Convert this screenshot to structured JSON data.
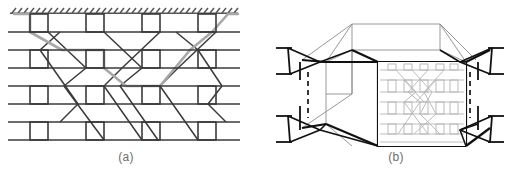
{
  "figure": {
    "type": "technical-schematic",
    "background_color": "#ffffff",
    "panels": [
      {
        "id": "a",
        "caption": "(a)",
        "description": "two-dimensional lattice network with crossing diagonal chains",
        "caption_color": "#6e6e6e"
      },
      {
        "id": "b",
        "caption": "(b)",
        "description": "three-dimensional perspective box with pinned supports and lattice front face",
        "caption_color": "#6e6e6e"
      }
    ]
  },
  "colors": {
    "line_dark": "#3a3a3a",
    "line_black": "#111111",
    "line_gray_path": "#a8a8a8",
    "line_thin_gray": "#8c8c8c",
    "line_light_lattice": "#b4b4b4",
    "hatch": "#555555",
    "caption": "#6e6e6e",
    "background": "#ffffff"
  },
  "panel_a": {
    "label": "(a)",
    "frame": {
      "x": 8,
      "y": 10,
      "width": 232,
      "height": 132
    },
    "boundary": {
      "name": "fixed-hatched-boundary",
      "y": 14,
      "x_start": 12,
      "x_end": 236,
      "hatch_count": 38,
      "hatch_angle_deg": 55
    },
    "band_count": 4,
    "band_rows": [
      {
        "top_y": 14,
        "bottom_y": 32
      },
      {
        "top_y": 50,
        "bottom_y": 68
      },
      {
        "top_y": 86,
        "bottom_y": 104
      },
      {
        "top_y": 122,
        "bottom_y": 140
      }
    ],
    "cells_per_band": 4,
    "cell_width": 18,
    "cell_x_positions": [
      30,
      86,
      142,
      198
    ],
    "horizontal_line_x": {
      "start": 8,
      "end": 240
    },
    "highlighted_path": {
      "name": "percolation-path",
      "color": "#a8a8a8",
      "stroke_width": 2.6,
      "points": "18,14 30,14 30,32 60,50 86,50 104,50 104,68 120,86 142,86 160,86 190,50 212,32 226,14 236,14"
    }
  },
  "panel_b": {
    "label": "(b)",
    "box": {
      "front_face": {
        "x": 378,
        "y": 62,
        "width": 88,
        "height": 84
      },
      "top_back_edge_y": 20,
      "perspective_offset_x": 52,
      "perspective_offset_y": 34
    },
    "front_face_lattice": {
      "name": "front-face-lattice",
      "color": "#b4b4b4",
      "rows": 4,
      "cells_per_row": 5
    },
    "supports": [
      {
        "name": "support-top-left",
        "x": 300,
        "y": 58,
        "facing": "left"
      },
      {
        "name": "support-top-right",
        "x": 478,
        "y": 58,
        "facing": "right"
      },
      {
        "name": "support-bottom-left",
        "x": 300,
        "y": 126,
        "facing": "left"
      },
      {
        "name": "support-bottom-right",
        "x": 478,
        "y": 126,
        "facing": "right"
      }
    ],
    "dashed_lines": [
      {
        "name": "dashed-left",
        "x": 308,
        "y1": 72,
        "y2": 118
      },
      {
        "name": "dashed-right",
        "x": 470,
        "y1": 72,
        "y2": 118
      }
    ]
  }
}
